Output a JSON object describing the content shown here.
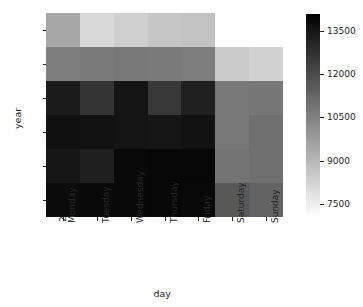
{
  "chart_data": {
    "type": "heatmap",
    "title": "",
    "xlabel": "day",
    "ylabel": "year",
    "x_categories": [
      "Monday",
      "Tuesday",
      "Wednesday",
      "Thursday",
      "Friday",
      "Saturday",
      "Sunday"
    ],
    "y_categories": [
      "2012",
      "2013",
      "2014",
      "2015",
      "2016",
      "2017"
    ],
    "colormap": "gray_r",
    "grid": false,
    "legend_position": "right-colorbar",
    "colorbar": {
      "orientation": "vertical",
      "ticks": [
        13500,
        12000,
        10500,
        9000,
        7500
      ],
      "tick_labels": [
        "13500",
        "12000",
        "10500",
        "9000",
        "7500"
      ],
      "vmin": 7000,
      "vmax": 14100,
      "low_color": "#ffffff",
      "high_color": "#000000"
    },
    "missing_value_color": "#ffffff",
    "rows": [
      {
        "year": "2012",
        "values": [
          9450,
          8050,
          8350,
          8600,
          8700,
          null,
          null
        ]
      },
      {
        "year": "2013",
        "values": [
          10600,
          10700,
          10750,
          10700,
          10650,
          8450,
          8250
        ]
      },
      {
        "year": "2014",
        "values": [
          13350,
          12650,
          13550,
          12550,
          13200,
          10750,
          10800
        ]
      },
      {
        "year": "2015",
        "values": [
          13650,
          13600,
          13550,
          13500,
          13600,
          10750,
          11000
        ]
      },
      {
        "year": "2016",
        "values": [
          13500,
          13250,
          13850,
          13900,
          13900,
          10900,
          11000
        ]
      },
      {
        "year": "2017",
        "values": [
          13800,
          13850,
          13850,
          13900,
          13850,
          11650,
          11350
        ]
      }
    ]
  },
  "axes": {
    "ylabel_text": "year",
    "xlabel_text": "day"
  }
}
